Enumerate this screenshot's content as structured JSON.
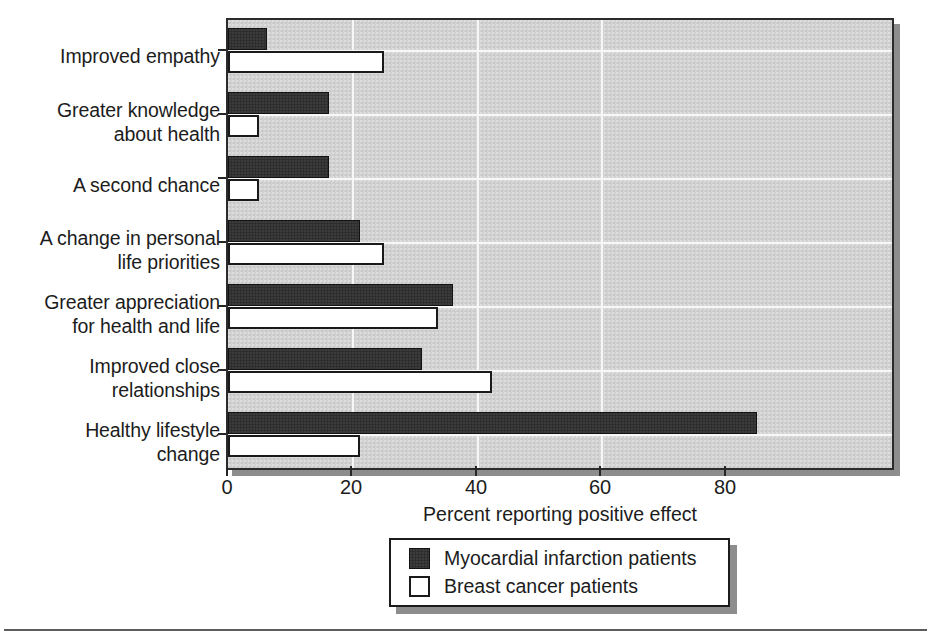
{
  "chart_data": {
    "type": "bar",
    "orientation": "horizontal",
    "title": "",
    "xlabel": "Percent reporting positive effect",
    "ylabel": "",
    "xlim": [
      0,
      80
    ],
    "xticks": [
      0,
      20,
      40,
      60,
      80
    ],
    "xtick_labels": [
      "0",
      "20",
      "40",
      "60",
      "80"
    ],
    "grid": true,
    "grid_axis": "both",
    "legend_position": "bottom-center",
    "categories": [
      "Improved empathy",
      "Greater knowledge about health",
      "A second chance",
      "A change in personal life priorities",
      "Greater appreciation for health and life",
      "Improved close relationships",
      "Healthy lifestyle change"
    ],
    "category_lines": [
      [
        "Improved empathy"
      ],
      [
        "Greater knowledge",
        "about health"
      ],
      [
        "A second chance"
      ],
      [
        "A change in personal",
        "life priorities"
      ],
      [
        "Greater appreciation",
        "for health and life"
      ],
      [
        "Improved close",
        "relationships"
      ],
      [
        "Healthy lifestyle",
        "change"
      ]
    ],
    "series": [
      {
        "name": "Myocardial infarction patients",
        "color": "#2e2e2e",
        "values": [
          5,
          13,
          13,
          17,
          29,
          25,
          68
        ]
      },
      {
        "name": "Breast cancer patients",
        "color": "#ffffff",
        "values": [
          20,
          4,
          4,
          20,
          27,
          34,
          17
        ]
      }
    ]
  },
  "legend": {
    "entries": [
      {
        "label": "Myocardial infarction patients",
        "swatch": "filled-dark-square"
      },
      {
        "label": "Breast cancer patients",
        "swatch": "open-white-square"
      }
    ]
  },
  "axis": {
    "x_title": "Percent reporting positive effect",
    "x_tick_labels": [
      "0",
      "20",
      "40",
      "60",
      "80"
    ]
  },
  "colors": {
    "plot_background": "#d2d2d2",
    "gridline": "#f7f7f7",
    "frame": "#2b2b2b",
    "shadow": "#8d8d8d",
    "series_mi": "#2e2e2e",
    "series_bc": "#ffffff",
    "text": "#1c1c1c"
  }
}
